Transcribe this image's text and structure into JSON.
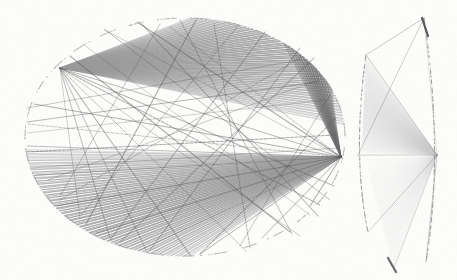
{
  "figure": {
    "canvas": {
      "width": 457,
      "height": 280
    },
    "background_color": "#fdfdfc",
    "ink_color": "#555555",
    "panels": [
      {
        "name": "left-ellipse-panel",
        "label": "Ellipse with radiating chords",
        "shape": "ellipse",
        "center": [
          185,
          137
        ],
        "radius_x": 160,
        "radius_y": 119,
        "outline_style": "dashed",
        "outline_color": "#8d8d8d",
        "hubs": [
          {
            "name": "right-hub",
            "point": [
              341,
              157
            ],
            "label": "primary convergence point"
          },
          {
            "name": "upper-left-hub",
            "point": [
              60,
              68
            ],
            "label": "upper-left fan origin"
          }
        ],
        "fans": [
          {
            "name": "top-crescent-fan",
            "origin": [
              60,
              68
            ],
            "fill_color": "#9b9b9b",
            "arc_start_deg": 6,
            "arc_end_deg": 88,
            "ray_count": 150,
            "opacity": 0.85
          },
          {
            "name": "bottom-crescent-fan",
            "origin": [
              341,
              157
            ],
            "fill_color": "#9a9a9a",
            "arc_start_deg": 186,
            "arc_end_deg": 272,
            "ray_count": 150,
            "opacity": 0.85
          },
          {
            "name": "right-sliver-fan",
            "origin": [
              341,
              157
            ],
            "fill_color": "#6b6b6b",
            "arc_start_deg": 24,
            "arc_end_deg": 52,
            "ray_count": 40,
            "opacity": 0.8
          }
        ],
        "chords": [
          [
            170,
            27,
            341,
            157
          ],
          [
            137,
            22,
            341,
            157
          ],
          [
            105,
            30,
            341,
            157
          ],
          [
            60,
            68,
            341,
            157
          ],
          [
            34,
            104,
            341,
            157
          ],
          [
            28,
            124,
            341,
            157
          ],
          [
            27,
            146,
            341,
            157
          ],
          [
            36,
            175,
            341,
            157
          ],
          [
            57,
            206,
            341,
            157
          ],
          [
            96,
            233,
            341,
            157
          ],
          [
            140,
            250,
            341,
            157
          ],
          [
            200,
            254,
            341,
            157
          ],
          [
            262,
            238,
            341,
            157
          ],
          [
            310,
            206,
            341,
            157
          ],
          [
            60,
            68,
            300,
            236
          ],
          [
            60,
            68,
            246,
            251
          ],
          [
            60,
            68,
            190,
            255
          ],
          [
            60,
            68,
            146,
            250
          ],
          [
            60,
            68,
            110,
            238
          ],
          [
            60,
            68,
            80,
            218
          ],
          [
            60,
            68,
            320,
            205
          ],
          [
            60,
            68,
            334,
            186
          ],
          [
            27,
            108,
            300,
            60
          ],
          [
            27,
            122,
            318,
            82
          ],
          [
            27,
            133,
            325,
            100
          ],
          [
            27,
            152,
            335,
            135
          ],
          [
            30,
            168,
            338,
            148
          ],
          [
            104,
            29,
            330,
            200
          ],
          [
            140,
            22,
            318,
            216
          ],
          [
            180,
            20,
            292,
            234
          ],
          [
            214,
            24,
            250,
            248
          ],
          [
            83,
            44,
            310,
            215
          ],
          [
            70,
            56,
            290,
            232
          ],
          [
            265,
            32,
            110,
            240
          ],
          [
            238,
            26,
            82,
            214
          ],
          [
            300,
            58,
            60,
            200
          ],
          [
            318,
            80,
            48,
            180
          ],
          [
            196,
            20,
            86,
            224
          ],
          [
            160,
            24,
            60,
            196
          ],
          [
            240,
            246,
            330,
            95
          ],
          [
            200,
            254,
            336,
            118
          ],
          [
            120,
            242,
            314,
            58
          ],
          [
            150,
            250,
            300,
            48
          ]
        ]
      },
      {
        "name": "right-lens-panel",
        "label": "Narrow lens with radiating chords",
        "shape": "lens",
        "left_arc": {
          "x_top": 366,
          "y_top": 55,
          "x_mid": 358,
          "y_mid": 155,
          "x_bot": 368,
          "y_bot": 232
        },
        "right_arc": {
          "x_top": 424,
          "y_top": 18,
          "x_mid": 438,
          "y_mid": 152,
          "x_bot": 426,
          "y_bot": 262
        },
        "outline_style": "dashed",
        "outline_color": "#8d8d8d",
        "hub": {
          "name": "lens-hub",
          "point": [
            437,
            155
          ],
          "label": "convergence point"
        },
        "fans": [
          {
            "name": "lens-upper-fan",
            "origin": [
              437,
              155
            ],
            "fill_color": "#c9c9c9",
            "target_from": [
              366,
              58
            ],
            "target_to": [
              362,
              152
            ],
            "ray_count": 90,
            "opacity": 0.7
          },
          {
            "name": "lens-lower-fan",
            "origin": [
              437,
              155
            ],
            "fill_color": "#d4d4d4",
            "target_from": [
              366,
              160
            ],
            "target_to": [
              394,
              268
            ],
            "ray_count": 45,
            "opacity": 0.6
          }
        ],
        "chords": [
          [
            424,
            18,
            437,
            155
          ],
          [
            366,
            55,
            437,
            155
          ],
          [
            358,
            155,
            437,
            155
          ],
          [
            368,
            232,
            437,
            155
          ],
          [
            426,
            262,
            437,
            155
          ],
          [
            394,
            268,
            437,
            155
          ],
          [
            424,
            18,
            366,
            55
          ],
          [
            424,
            18,
            358,
            155
          ]
        ],
        "dark_segments": [
          {
            "name": "lens-top-dark-tick",
            "from": [
              422,
              18
            ],
            "to": [
              428,
              36
            ],
            "color": "#4a4a4a"
          },
          {
            "name": "lens-bottom-dark-tick",
            "from": [
              388,
              258
            ],
            "to": [
              396,
              272
            ],
            "color": "#5a5a5a"
          }
        ]
      }
    ]
  }
}
